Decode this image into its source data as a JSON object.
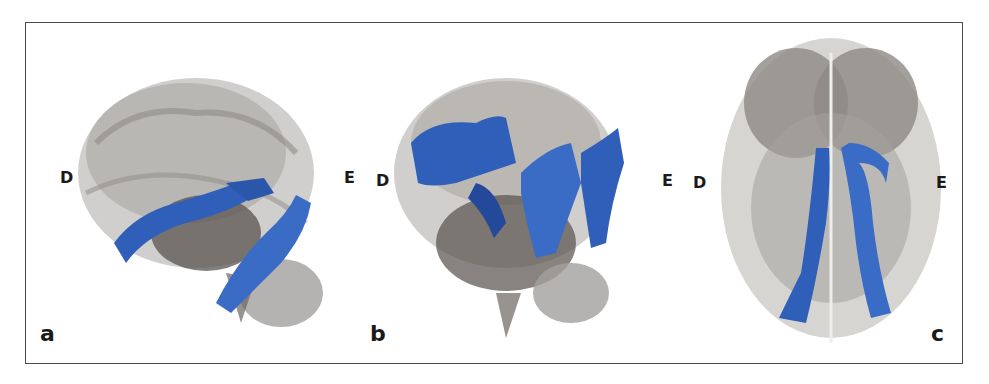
{
  "figure": {
    "panels": [
      {
        "id": "a",
        "panel_label": "a",
        "left_label": "D",
        "right_label": "E",
        "view": "lateral"
      },
      {
        "id": "b",
        "panel_label": "b",
        "left_label": "D",
        "right_label": "E",
        "view": "lateral"
      },
      {
        "id": "c",
        "panel_label": "c",
        "left_label": "D",
        "right_label": "E",
        "view": "axial"
      }
    ],
    "colors": {
      "brain_shell": "#b8b6b3",
      "brain_dark": "#4e4845",
      "tract_blue": "#2f5fb8",
      "tract_dark": "#1e3c80",
      "border": "#4a4a4a",
      "text": "#1a1a1a"
    }
  }
}
